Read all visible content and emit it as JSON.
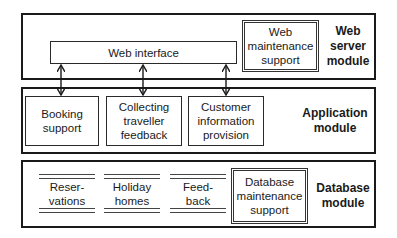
{
  "web_server_module": {
    "label": "Web\nserver\nmodule",
    "web_interface": "Web interface",
    "web_maintenance": "Web\nmaintenance\nsupport"
  },
  "application_module": {
    "label": "Application\nmodule",
    "components": [
      {
        "label": "Booking\nsupport"
      },
      {
        "label": "Collecting\ntraveller\nfeedback"
      },
      {
        "label": "Customer\ninformation\nprovision"
      }
    ]
  },
  "database_module": {
    "label": "Database\nmodule",
    "data_stores": [
      {
        "label": "Reser-\nvations"
      },
      {
        "label": "Holiday\nhomes"
      },
      {
        "label": "Feed-\nback"
      }
    ],
    "database_maintenance": "Database\nmaintenance\nsupport"
  },
  "connections": [
    {
      "from": "Web interface",
      "to": "Booking support",
      "type": "bidirectional"
    },
    {
      "from": "Web interface",
      "to": "Collecting traveller feedback",
      "type": "bidirectional"
    },
    {
      "from": "Web interface",
      "to": "Customer information provision",
      "type": "bidirectional"
    }
  ]
}
